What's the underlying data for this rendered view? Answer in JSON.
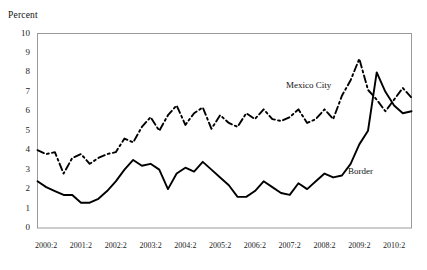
{
  "chart_data": {
    "type": "line",
    "title": "",
    "subtitle": "",
    "xlabel": "",
    "ylabel": "Percent",
    "ylim": [
      0,
      10
    ],
    "xlim": [
      "2000:1",
      "2010:4"
    ],
    "grid": false,
    "legend_position": "inline-annotation",
    "yticks": [
      "0",
      "1",
      "2",
      "3",
      "4",
      "5",
      "6",
      "7",
      "8",
      "9",
      "10"
    ],
    "xticks": [
      "2000:2",
      "2001:2",
      "2002:2",
      "2003:2",
      "2004:2",
      "2005:2",
      "2006:2",
      "2007:2",
      "2008:2",
      "2009:2",
      "2010:2"
    ],
    "x": [
      "2000:1",
      "2000:2",
      "2000:3",
      "2000:4",
      "2001:1",
      "2001:2",
      "2001:3",
      "2001:4",
      "2002:1",
      "2002:2",
      "2002:3",
      "2002:4",
      "2003:1",
      "2003:2",
      "2003:3",
      "2003:4",
      "2004:1",
      "2004:2",
      "2004:3",
      "2004:4",
      "2005:1",
      "2005:2",
      "2005:3",
      "2005:4",
      "2006:1",
      "2006:2",
      "2006:3",
      "2006:4",
      "2007:1",
      "2007:2",
      "2007:3",
      "2007:4",
      "2008:1",
      "2008:2",
      "2008:3",
      "2008:4",
      "2009:1",
      "2009:2",
      "2009:3",
      "2009:4",
      "2010:1",
      "2010:2",
      "2010:3",
      "2010:4"
    ],
    "series": [
      {
        "name": "Mexico City",
        "style": "dashed",
        "color": "#000000",
        "values": [
          4.0,
          3.8,
          3.9,
          2.8,
          3.6,
          3.8,
          3.3,
          3.6,
          3.8,
          3.9,
          4.6,
          4.4,
          5.2,
          5.7,
          5.0,
          5.8,
          6.3,
          5.3,
          5.9,
          6.2,
          5.1,
          5.8,
          5.4,
          5.2,
          5.9,
          5.6,
          6.1,
          5.6,
          5.5,
          5.7,
          6.1,
          5.4,
          5.6,
          6.1,
          5.6,
          6.8,
          7.6,
          8.7,
          7.1,
          6.6,
          6.0,
          6.6,
          7.2,
          6.7
        ]
      },
      {
        "name": "Border",
        "style": "solid",
        "color": "#000000",
        "values": [
          2.4,
          2.1,
          1.9,
          1.7,
          1.7,
          1.3,
          1.3,
          1.5,
          1.9,
          2.4,
          3.0,
          3.5,
          3.2,
          3.3,
          3.0,
          2.0,
          2.8,
          3.1,
          2.9,
          3.4,
          3.0,
          2.6,
          2.2,
          1.6,
          1.6,
          1.9,
          2.4,
          2.1,
          1.8,
          1.7,
          2.3,
          2.0,
          2.4,
          2.8,
          2.6,
          2.7,
          3.3,
          4.3,
          5.0,
          8.0,
          7.0,
          6.3,
          5.9,
          6.0
        ]
      }
    ],
    "annotations": [
      {
        "text": "Mexico City",
        "series": "Mexico City"
      },
      {
        "text": "Border",
        "series": "Border"
      }
    ]
  },
  "axis": {
    "y_title": "Percent"
  }
}
